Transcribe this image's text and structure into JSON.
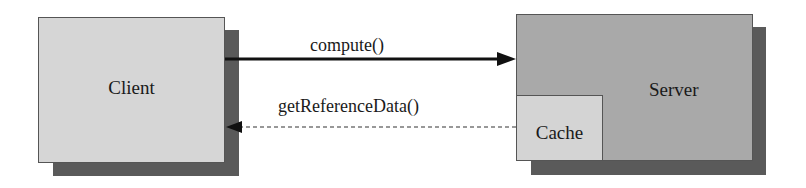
{
  "diagram": {
    "nodes": {
      "client": {
        "label": "Client",
        "fill": "#d6d6d6"
      },
      "server": {
        "label": "Server",
        "fill": "#a9a9a9"
      },
      "cache": {
        "label": "Cache",
        "fill": "#d4d4d4",
        "parent": "server"
      }
    },
    "edges": [
      {
        "from": "client",
        "to": "server",
        "label": "compute()",
        "style": "solid"
      },
      {
        "from": "cache",
        "to": "client",
        "label": "getReferenceData()",
        "style": "dashed"
      }
    ],
    "shadow_color": "#5a5a5a"
  }
}
